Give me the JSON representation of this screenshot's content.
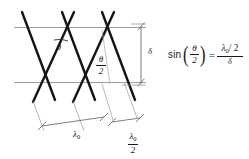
{
  "diagram": {
    "background_color": "#ffffff",
    "line_color": "#1a1a1a",
    "guide_color": "#9a9a9a",
    "dimension_color": "#7d7d7d",
    "labels": {
      "theta": "θ",
      "theta_half_num": "θ",
      "theta_half_den": "2",
      "delta": "δ",
      "lambda0": "λ",
      "lambda0_sub": "0",
      "lambda0_half_num_symbol": "λ",
      "lambda0_half_num_sub": "0",
      "lambda0_half_den": "2"
    }
  },
  "equation": {
    "function_name": "sin",
    "open_paren": "(",
    "close_paren": ")",
    "arg_numerator": "θ",
    "arg_denominator": "2",
    "equals": "=",
    "rhs_numerator_lambda": "λ",
    "rhs_numerator_sub": "0",
    "rhs_numerator_rest": "/ 2",
    "rhs_denominator": "δ",
    "plain_text": "sin(θ/2) = (λ₀/2)/δ"
  }
}
